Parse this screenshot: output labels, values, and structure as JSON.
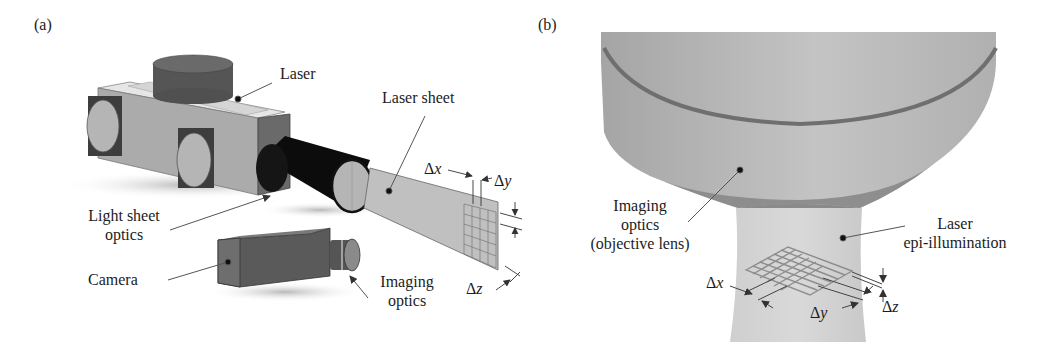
{
  "panels": {
    "a": {
      "tag": "(a)",
      "labels": {
        "laser": "Laser",
        "laser_sheet": "Laser sheet",
        "light_sheet_optics_line1": "Light sheet",
        "light_sheet_optics_line2": "optics",
        "camera": "Camera",
        "imaging_optics_line1": "Imaging",
        "imaging_optics_line2": "optics"
      },
      "dimensions": {
        "dx_delta": "Δ",
        "dx_var": "x",
        "dy_delta": "Δ",
        "dy_var": "y",
        "dz_delta": "Δ",
        "dz_var": "z"
      },
      "grid": {
        "rows": 5,
        "cols": 4
      }
    },
    "b": {
      "tag": "(b)",
      "labels": {
        "imaging_optics_line1": "Imaging",
        "imaging_optics_line2": "optics",
        "imaging_optics_line3": "(objective lens)",
        "laser_epi_line1": "Laser",
        "laser_epi_line2": "epi-illumination"
      },
      "dimensions": {
        "dx_delta": "Δ",
        "dx_var": "x",
        "dy_delta": "Δ",
        "dy_var": "y",
        "dz_delta": "Δ",
        "dz_var": "z"
      },
      "grid": {
        "rows": 5,
        "cols": 6
      }
    }
  },
  "colors": {
    "background": "#ffffff",
    "laser_body": "#a9a9a9",
    "laser_dark": "#4a4a4a",
    "tube": "#0d0d0d",
    "sheet": "#bdbdbd",
    "camera": "#5c5c5c",
    "objective": "#b4b4b4",
    "objective_band": "#8a8a8a",
    "beam": "#d2d2d2",
    "text": "#1c1c1c"
  }
}
